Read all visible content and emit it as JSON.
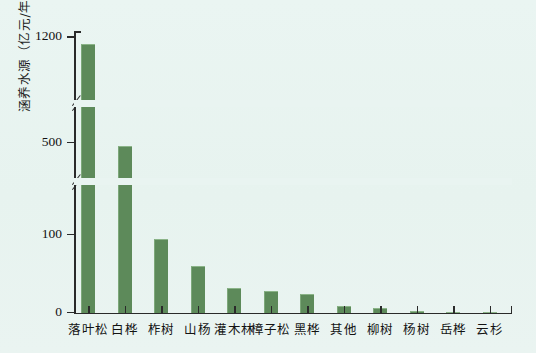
{
  "chart_data": {
    "type": "bar",
    "title": "",
    "xlabel": "",
    "ylabel": "涵养水源（亿元/年）",
    "categories": [
      "落叶松",
      "白桦",
      "柞树",
      "山杨",
      "灌木林",
      "樟子松",
      "黑桦",
      "其他",
      "柳树",
      "杨树",
      "岳桦",
      "云杉"
    ],
    "values": [
      1160,
      488,
      95,
      60,
      32,
      28,
      25,
      9,
      7,
      3,
      1,
      0.5
    ],
    "ytick_labels": [
      "0",
      "100",
      "500",
      "1200"
    ],
    "ytick_values": [
      0,
      100,
      500,
      1200
    ],
    "ylim": [
      0,
      1200
    ],
    "axis_breaks": [
      {
        "label": "break-lower",
        "between": [
          100,
          500
        ]
      },
      {
        "label": "break-upper",
        "between": [
          500,
          1200
        ]
      }
    ],
    "grid": false,
    "legend": "none",
    "bar_color": "#5d8a5a",
    "background_color": "#e9f4f1",
    "axis_color": "#2a2a2a"
  }
}
